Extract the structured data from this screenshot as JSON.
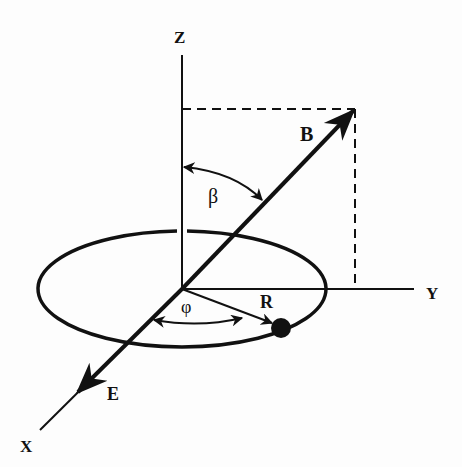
{
  "figure": {
    "type": "3D coordinate diagram",
    "axes": {
      "x_label": "X",
      "y_label": "Y",
      "z_label": "Z"
    },
    "vectors": {
      "b_label": "B",
      "e_label": "E",
      "r_label": "R"
    },
    "angles": {
      "beta_label": "β",
      "phi_label": "φ"
    },
    "colors": {
      "ink": "#111111",
      "background": "#fdfdfd"
    }
  }
}
